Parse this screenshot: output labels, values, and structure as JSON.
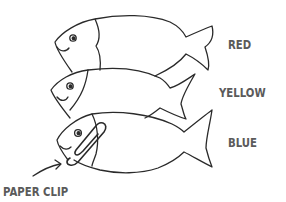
{
  "figure": {
    "title": "",
    "stroke_color": "#2a2a2a",
    "label_color": "#5a5a5a",
    "fish": [
      {
        "label": "RED",
        "position": "top"
      },
      {
        "label": "YELLOW",
        "position": "middle"
      },
      {
        "label": "BLUE",
        "position": "bottom"
      }
    ],
    "annotation": {
      "label": "PAPER CLIP",
      "icon": "arrow-icon"
    }
  }
}
